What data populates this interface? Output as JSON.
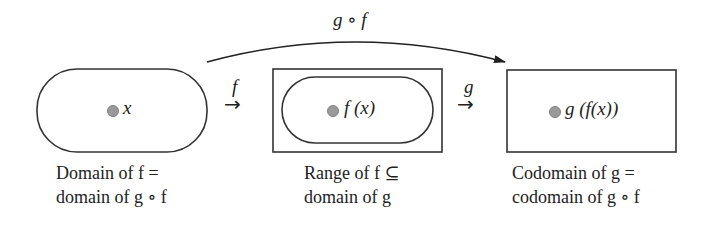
{
  "diagram": {
    "composition_arrow": {
      "label": "g ∘ f",
      "from": "domain-of-f",
      "to": "codomain-of-g"
    },
    "map_f": {
      "label": "f",
      "arrow": "→"
    },
    "map_g": {
      "label": "g",
      "arrow": "→"
    },
    "sets": [
      {
        "id": "domain-of-f",
        "shape": "rounded-pill",
        "element": "x",
        "caption_line1": "Domain of f =",
        "caption_line2": "domain of g ∘ f"
      },
      {
        "id": "range-of-f",
        "shape": "rectangle-containing-pill",
        "element": "f (x)",
        "caption_line1": "Range of f ⊆",
        "caption_line2": "domain of g"
      },
      {
        "id": "codomain-of-g",
        "shape": "rectangle",
        "element": "g (f(x))",
        "caption_line1": "Codomain of g =",
        "caption_line2": "codomain of g ∘ f"
      }
    ],
    "colors": {
      "stroke": "#333333",
      "dot_fill": "#9a9a9a",
      "background": "#ffffff"
    }
  }
}
